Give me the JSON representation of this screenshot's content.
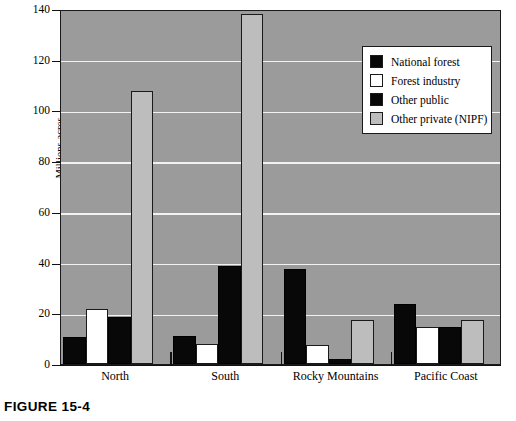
{
  "figure": {
    "caption": "FIGURE 15-4"
  },
  "chart_data": {
    "type": "bar",
    "title": "",
    "subtitle": "",
    "xlabel": "",
    "ylabel": "Millions acres",
    "ylim": [
      0,
      140
    ],
    "yticks": [
      0,
      20,
      40,
      60,
      80,
      100,
      120,
      140
    ],
    "ytick_labels": [
      "0",
      "20",
      "40",
      "60",
      "80",
      "100",
      "120",
      "140"
    ],
    "grid": "horizontal",
    "grid_color": "#f2f2f2",
    "plot_background": "#9b9b9b",
    "legend_position": "top-right",
    "categories": [
      "North",
      "South",
      "Rocky Mountains",
      "Pacific Coast"
    ],
    "series": [
      {
        "name": "National forest",
        "color": "#080808",
        "values": [
          10.5,
          11.0,
          37.5,
          23.5
        ]
      },
      {
        "name": "Forest industry",
        "color": "#ffffff",
        "values": [
          21.5,
          8.0,
          7.5,
          14.5
        ]
      },
      {
        "name": "Other public",
        "color": "#080808",
        "values": [
          18.5,
          38.5,
          2.0,
          14.5
        ]
      },
      {
        "name": "Other private (NIPF)",
        "color": "#bdbdbd",
        "values": [
          107.5,
          138.0,
          17.5,
          17.5
        ]
      }
    ]
  }
}
